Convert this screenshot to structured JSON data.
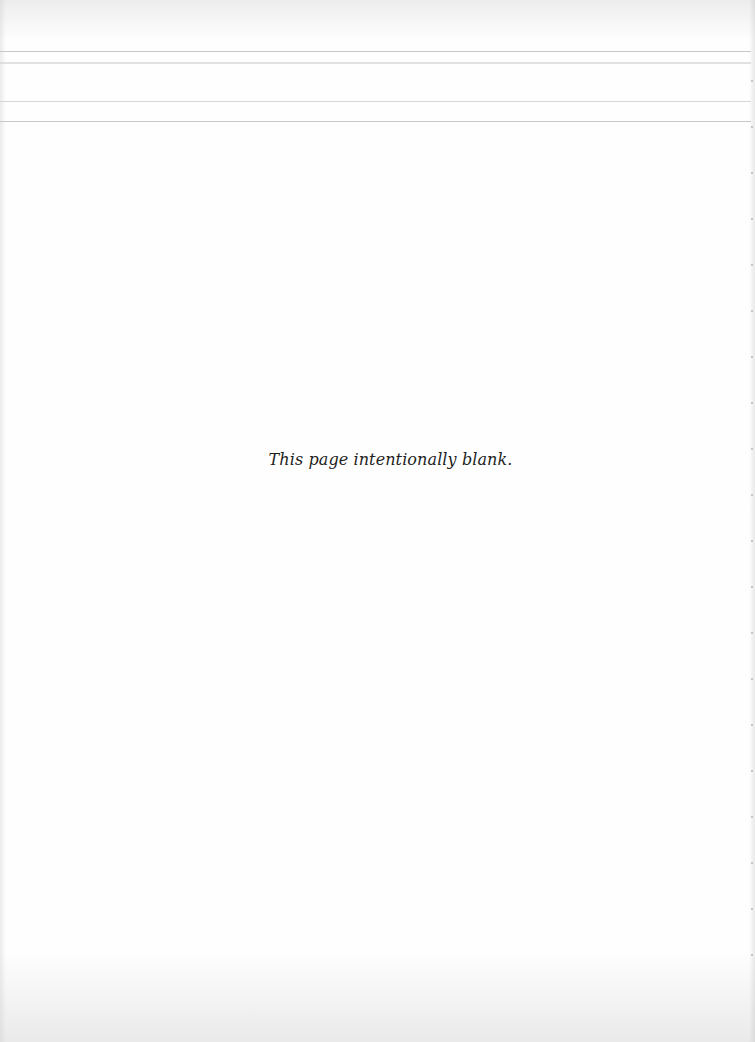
{
  "page": {
    "notice": "This page intentionally blank."
  }
}
